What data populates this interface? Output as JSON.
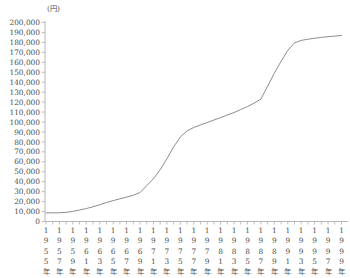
{
  "chart_data": {
    "type": "line",
    "title": "",
    "unit_label": "(円)",
    "xlabel": "",
    "ylabel": "",
    "ylim": [
      0,
      200000
    ],
    "y_tick_step": 10000,
    "grid": false,
    "legend": "none",
    "x": [
      1955,
      1956,
      1957,
      1958,
      1959,
      1960,
      1961,
      1962,
      1963,
      1964,
      1965,
      1966,
      1967,
      1968,
      1969,
      1970,
      1971,
      1972,
      1973,
      1974,
      1975,
      1976,
      1977,
      1978,
      1979,
      1980,
      1981,
      1982,
      1983,
      1984,
      1985,
      1986,
      1987,
      1988,
      1989,
      1990,
      1991,
      1992,
      1993,
      1994,
      1995,
      1996,
      1997,
      1998,
      1999
    ],
    "series": [
      {
        "name": "yen-amount",
        "values": [
          8700,
          8700,
          8800,
          9200,
          10200,
          11500,
          13000,
          14800,
          16800,
          19100,
          21000,
          22800,
          24500,
          26400,
          29100,
          36100,
          43000,
          52000,
          63000,
          75000,
          85000,
          91000,
          94500,
          97000,
          99500,
          102000,
          104500,
          107000,
          109500,
          112500,
          115500,
          119000,
          123000,
          136000,
          149000,
          161000,
          172000,
          179500,
          182000,
          183200,
          184200,
          185000,
          185800,
          186300,
          187000
        ]
      }
    ],
    "y_tick_labels": [
      "0",
      "10,000",
      "20,000",
      "30,000",
      "40,000",
      "50,000",
      "60,000",
      "70,000",
      "80,000",
      "90,000",
      "100,000",
      "110,000",
      "120,000",
      "130,000",
      "140,000",
      "150,000",
      "160,000",
      "170,000",
      "180,000",
      "190,000",
      "200,000"
    ],
    "x_tick_labels": [
      "1955年",
      "1957年",
      "1959年",
      "1961年",
      "1963年",
      "1965年",
      "1967年",
      "1969年",
      "1971年",
      "1973年",
      "1975年",
      "1977年",
      "1979年",
      "1981年",
      "1983年",
      "1985年",
      "1987年",
      "1989年",
      "1991年",
      "1993年",
      "1995年",
      "1997年",
      "1999年"
    ],
    "x_label_every_n_years": 2,
    "colors": {
      "background": "#ffffff",
      "line": "#8d8d8d",
      "axis": "#aeaeae",
      "tick": "#aeaeae",
      "text": "#4f4f4f"
    }
  }
}
